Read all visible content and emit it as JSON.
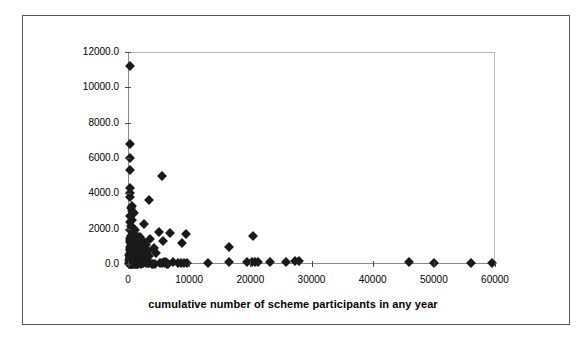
{
  "figure": {
    "frame_color": "#555555",
    "background": "#ffffff"
  },
  "axis_title_x": "cumulative number of scheme participants in any year",
  "chart_data": {
    "type": "scatter",
    "title": "",
    "subtitle": "",
    "xlabel": "cumulative number of scheme participants in any year",
    "ylabel": "",
    "xlim": [
      0,
      60000
    ],
    "ylim": [
      0,
      12000
    ],
    "xticks": [
      0,
      10000,
      20000,
      30000,
      40000,
      50000,
      60000
    ],
    "xticklabels": [
      "0",
      "10000",
      "20000",
      "30000",
      "40000",
      "50000",
      "60000"
    ],
    "yticks": [
      0,
      2000,
      4000,
      6000,
      8000,
      10000,
      12000
    ],
    "yticklabels": [
      "0.0",
      "2000.0",
      "4000.0",
      "6000.0",
      "8000.0",
      "10000.0",
      "12000.0"
    ],
    "grid": false,
    "legend": null,
    "marker": "diamond",
    "marker_color": "#1a1a1a",
    "marker_size": 7,
    "series": [
      {
        "name": "schemes",
        "points": [
          [
            300,
            11200
          ],
          [
            250,
            6800
          ],
          [
            300,
            6000
          ],
          [
            350,
            5300
          ],
          [
            5500,
            5000
          ],
          [
            400,
            4300
          ],
          [
            300,
            4000
          ],
          [
            250,
            3800
          ],
          [
            3400,
            3650
          ],
          [
            600,
            3300
          ],
          [
            500,
            3150
          ],
          [
            700,
            3000
          ],
          [
            900,
            2900
          ],
          [
            400,
            2700
          ],
          [
            600,
            2500
          ],
          [
            300,
            2350
          ],
          [
            2600,
            2250
          ],
          [
            500,
            2150
          ],
          [
            800,
            2050
          ],
          [
            350,
            1950
          ],
          [
            1100,
            1900
          ],
          [
            5000,
            1800
          ],
          [
            6800,
            1750
          ],
          [
            9500,
            1700
          ],
          [
            700,
            1650
          ],
          [
            450,
            1600
          ],
          [
            1400,
            1580
          ],
          [
            900,
            1550
          ],
          [
            2000,
            1520
          ],
          [
            260,
            1500
          ],
          [
            1700,
            1480
          ],
          [
            600,
            1450
          ],
          [
            3600,
            1420
          ],
          [
            1000,
            1400
          ],
          [
            400,
            1380
          ],
          [
            1200,
            1350
          ],
          [
            2400,
            1320
          ],
          [
            750,
            1300
          ],
          [
            5800,
            1280
          ],
          [
            300,
            1250
          ],
          [
            1600,
            1220
          ],
          [
            8800,
            1200
          ],
          [
            550,
            1180
          ],
          [
            2800,
            1150
          ],
          [
            1000,
            1130
          ],
          [
            450,
            1100
          ],
          [
            3000,
            1080
          ],
          [
            1900,
            1050
          ],
          [
            700,
            1030
          ],
          [
            1300,
            1000
          ],
          [
            20500,
            1600
          ],
          [
            16500,
            950
          ],
          [
            350,
            980
          ],
          [
            2200,
            960
          ],
          [
            900,
            940
          ],
          [
            4200,
            920
          ],
          [
            600,
            900
          ],
          [
            1500,
            880
          ],
          [
            250,
            860
          ],
          [
            1100,
            840
          ],
          [
            2600,
            820
          ],
          [
            800,
            800
          ],
          [
            400,
            780
          ],
          [
            1800,
            760
          ],
          [
            3300,
            740
          ],
          [
            1000,
            720
          ],
          [
            550,
            700
          ],
          [
            2100,
            680
          ],
          [
            1300,
            660
          ],
          [
            300,
            640
          ],
          [
            700,
            620
          ],
          [
            4500,
            600
          ],
          [
            1600,
            580
          ],
          [
            950,
            560
          ],
          [
            2400,
            540
          ],
          [
            450,
            520
          ],
          [
            1200,
            500
          ],
          [
            200,
            490
          ],
          [
            2900,
            480
          ],
          [
            800,
            470
          ],
          [
            1500,
            460
          ],
          [
            600,
            450
          ],
          [
            3500,
            440
          ],
          [
            1000,
            430
          ],
          [
            350,
            420
          ],
          [
            2000,
            410
          ],
          [
            1300,
            400
          ],
          [
            500,
            390
          ],
          [
            900,
            380
          ],
          [
            1800,
            370
          ],
          [
            250,
            360
          ],
          [
            1100,
            350
          ],
          [
            650,
            340
          ],
          [
            2300,
            330
          ],
          [
            400,
            320
          ],
          [
            1400,
            310
          ],
          [
            850,
            300
          ],
          [
            300,
            290
          ],
          [
            1700,
            280
          ],
          [
            1050,
            270
          ],
          [
            550,
            260
          ],
          [
            2100,
            250
          ],
          [
            750,
            240
          ],
          [
            200,
            230
          ],
          [
            1250,
            220
          ],
          [
            450,
            210
          ],
          [
            1550,
            200
          ],
          [
            950,
            190
          ],
          [
            350,
            180
          ],
          [
            2800,
            175
          ],
          [
            600,
            170
          ],
          [
            1150,
            160
          ],
          [
            260,
            150
          ],
          [
            1900,
            145
          ],
          [
            800,
            140
          ],
          [
            420,
            130
          ],
          [
            1350,
            125
          ],
          [
            1000,
            120
          ],
          [
            300,
            110
          ],
          [
            2200,
            105
          ],
          [
            700,
            100
          ],
          [
            500,
            95
          ],
          [
            1600,
            90
          ],
          [
            900,
            85
          ],
          [
            230,
            80
          ],
          [
            1200,
            75
          ],
          [
            3300,
            70
          ],
          [
            640,
            65
          ],
          [
            400,
            60
          ],
          [
            1800,
            55
          ],
          [
            1000,
            50
          ],
          [
            290,
            45
          ],
          [
            2500,
            40
          ],
          [
            760,
            35
          ],
          [
            520,
            30
          ],
          [
            1450,
            28
          ],
          [
            880,
            25
          ],
          [
            200,
            22
          ],
          [
            1100,
            20
          ],
          [
            4100,
            18
          ],
          [
            340,
            15
          ],
          [
            1700,
            12
          ],
          [
            660,
            10
          ],
          [
            2050,
            8
          ],
          [
            450,
            6
          ],
          [
            980,
            5
          ],
          [
            1300,
            4
          ],
          [
            280,
            3
          ],
          [
            1550,
            2
          ],
          [
            700,
            2
          ],
          [
            5300,
            60
          ],
          [
            5600,
            40
          ],
          [
            6000,
            30
          ],
          [
            6300,
            20
          ],
          [
            6600,
            15
          ],
          [
            5900,
            100
          ],
          [
            6200,
            90
          ],
          [
            7400,
            130
          ],
          [
            8200,
            60
          ],
          [
            8600,
            50
          ],
          [
            9200,
            40
          ],
          [
            9600,
            30
          ],
          [
            13000,
            80
          ],
          [
            16500,
            140
          ],
          [
            19500,
            110
          ],
          [
            20200,
            100
          ],
          [
            20700,
            95
          ],
          [
            21200,
            90
          ],
          [
            23200,
            120
          ],
          [
            25800,
            130
          ],
          [
            27300,
            150
          ],
          [
            27900,
            145
          ],
          [
            46000,
            90
          ],
          [
            50000,
            60
          ],
          [
            56000,
            50
          ],
          [
            59500,
            45
          ],
          [
            2900,
            60
          ],
          [
            3200,
            45
          ],
          [
            3600,
            35
          ],
          [
            4000,
            25
          ],
          [
            4400,
            18
          ],
          [
            2400,
            80
          ],
          [
            2000,
            95
          ],
          [
            1500,
            150
          ],
          [
            1150,
            200
          ],
          [
            850,
            260
          ],
          [
            600,
            330
          ],
          [
            380,
            420
          ],
          [
            260,
            530
          ]
        ]
      }
    ]
  }
}
